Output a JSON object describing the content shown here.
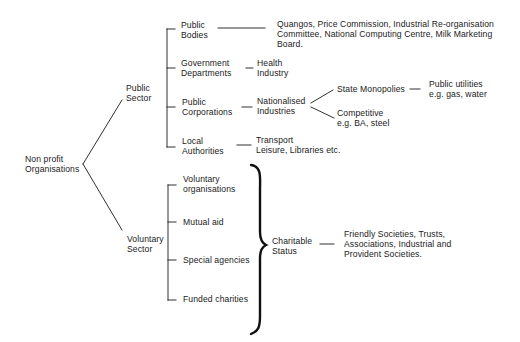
{
  "diagram": {
    "root": {
      "line1": "Non profit",
      "line2": "Organisations"
    },
    "public_sector": {
      "label": {
        "line1": "Public",
        "line2": "Sector"
      },
      "children": [
        {
          "label": {
            "line1": "Public",
            "line2": "Bodies"
          },
          "detail": {
            "line1": "Quangos, Price Commission, Industrial Re-organisation",
            "line2": "Committee, National Computing Centre, Milk Marketing",
            "line3": "Board."
          }
        },
        {
          "label": {
            "line1": "Government",
            "line2": "Departments"
          },
          "detail": {
            "line1": "Health",
            "line2": "Industry"
          }
        },
        {
          "label": {
            "line1": "Public",
            "line2": "Corporations"
          },
          "detail": {
            "line1": "Nationalised",
            "line2": "Industries"
          },
          "branches": [
            {
              "label": "State Monopolies",
              "detail": {
                "line1": "Public utilities",
                "line2": "e.g. gas, water"
              }
            },
            {
              "label": {
                "line1": "Competitive",
                "line2": "e.g. BA, steel"
              }
            }
          ]
        },
        {
          "label": {
            "line1": "Local",
            "line2": "Authorities"
          },
          "detail": {
            "line1": "Transport",
            "line2": "Leisure, Libraries etc."
          }
        }
      ]
    },
    "voluntary_sector": {
      "label": {
        "line1": "Voluntary",
        "line2": "Sector"
      },
      "children": [
        {
          "line1": "Voluntary",
          "line2": "organisations"
        },
        {
          "line1": "Mutual aid"
        },
        {
          "line1": "Special agencies"
        },
        {
          "line1": "Funded charities"
        }
      ],
      "grouped_as": {
        "label": {
          "line1": "Charitable",
          "line2": "Status"
        },
        "detail": {
          "line1": "Friendly Societies, Trusts,",
          "line2": "Associations, Industrial and",
          "line3": "Provident Societies."
        }
      }
    },
    "colors": {
      "ink": "#1a1a1a",
      "background": "#ffffff"
    }
  }
}
